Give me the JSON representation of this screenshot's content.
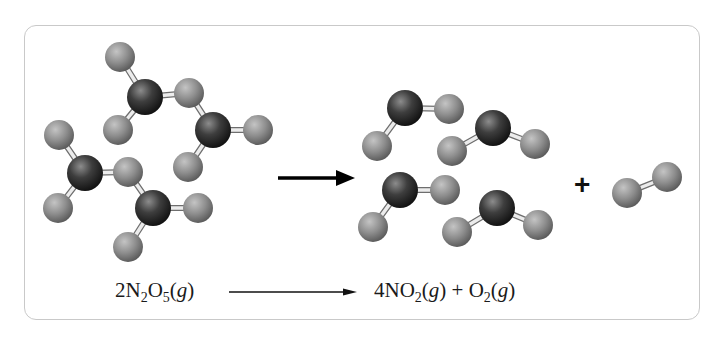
{
  "diagram": {
    "reactants": {
      "formula_label": "2N2O5(g)",
      "coefficient": "2",
      "species": [
        {
          "symbol": "N",
          "sub": "2"
        },
        {
          "symbol": "O",
          "sub": "5"
        }
      ],
      "state": "g",
      "molecule_count": 2
    },
    "products": [
      {
        "coefficient": "4",
        "species": [
          {
            "symbol": "N",
            "sub": ""
          },
          {
            "symbol": "O",
            "sub": "2"
          }
        ],
        "state": "g",
        "molecule_count": 4
      },
      {
        "coefficient": "",
        "species": [
          {
            "symbol": "O",
            "sub": "2"
          }
        ],
        "state": "g",
        "molecule_count": 1
      }
    ],
    "plus_sign": "+",
    "equation_plus": "+",
    "arrow": "reaction-arrow",
    "colors": {
      "nitrogen_atom": "#2e2e2e",
      "oxygen_atom": "#8a8a8a",
      "bond": "#e6e6e6",
      "frame_border": "#c9c9c9",
      "text": "#1a1a1a"
    }
  },
  "eq": {
    "left_coef": "2",
    "left_n": "N",
    "left_n_sub": "2",
    "left_o": "O",
    "left_o_sub": "5",
    "open_paren": "(",
    "state": "g",
    "close_paren": ")",
    "right_coef": "4",
    "right_no": "NO",
    "right_no_sub": "2",
    "plus": " + ",
    "right_o": "O",
    "right_o_sub": "2"
  }
}
